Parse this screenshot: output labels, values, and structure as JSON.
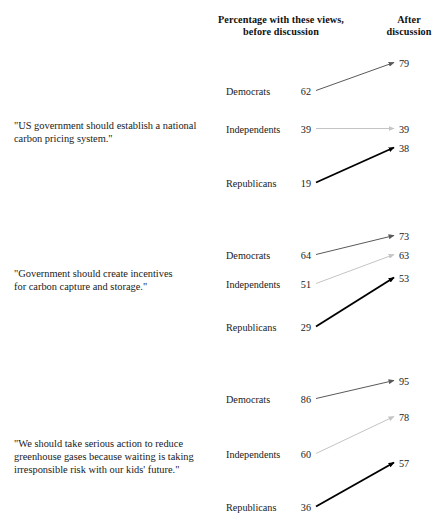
{
  "header": {
    "before_label": "Percentage with these views, before discussion",
    "before_line1": "Percentage with these views,",
    "before_line2": "before discussion",
    "after_line1": "After",
    "after_line2": "discussion"
  },
  "chart_data": {
    "type": "line",
    "xlabel": "",
    "ylabel": "",
    "x": [
      "before discussion",
      "after discussion"
    ],
    "grid": false,
    "legend": "none",
    "axis_range": [
      0,
      100
    ],
    "panels": [
      {
        "caption": "\"US government should establish a national carbon pricing system.\"",
        "caption_line1": "\"US government should establish a national",
        "caption_line2": "carbon pricing system.\"",
        "series": [
          {
            "name": "Democrats",
            "before": 62,
            "after": 79,
            "color": "#595959"
          },
          {
            "name": "Independents",
            "before": 39,
            "after": 39,
            "color": "#c4c4c4"
          },
          {
            "name": "Republicans",
            "before": 19,
            "after": 38,
            "color": "#000000"
          }
        ]
      },
      {
        "caption": "\"Government should create incentives for carbon capture and storage.\"",
        "caption_line1": "\"Government should create incentives",
        "caption_line2": "for carbon capture and storage.\"",
        "series": [
          {
            "name": "Democrats",
            "before": 64,
            "after": 73,
            "color": "#595959"
          },
          {
            "name": "Independents",
            "before": 51,
            "after": 63,
            "color": "#c4c4c4"
          },
          {
            "name": "Republicans",
            "before": 29,
            "after": 53,
            "color": "#000000"
          }
        ]
      },
      {
        "caption": "\"We should take serious action to reduce greenhouse gases because waiting is taking irresponsible risk with our kids' future.\"",
        "caption_line1": "\"We should take serious action to reduce",
        "caption_line2": "greenhouse gases because waiting is taking",
        "caption_line3": "irresponsible risk with our kids' future.\"",
        "series": [
          {
            "name": "Democrats",
            "before": 86,
            "after": 95,
            "color": "#595959"
          },
          {
            "name": "Independents",
            "before": 60,
            "after": 78,
            "color": "#c4c4c4"
          },
          {
            "name": "Republicans",
            "before": 36,
            "after": 57,
            "color": "#000000"
          }
        ]
      }
    ]
  },
  "layout": {
    "label_x": 226,
    "before_value_right_x": 311,
    "arrow_start_x": 316,
    "arrow_end_x": 394,
    "after_value_x": 399,
    "row_y": [
      [
        92,
        130,
        184
      ],
      [
        256,
        285,
        328
      ],
      [
        400,
        455,
        508
      ]
    ],
    "after_y": [
      [
        64,
        130,
        149
      ],
      [
        237,
        256,
        279
      ],
      [
        382,
        418,
        464
      ]
    ]
  },
  "colors": {
    "background": "#ffffff",
    "text": "#1a1a1a",
    "democrat_line": "#595959",
    "independent_line": "#c4c4c4",
    "republican_line": "#000000"
  }
}
